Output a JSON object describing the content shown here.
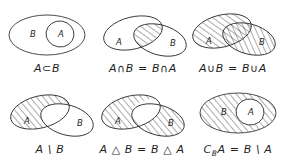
{
  "figure": {
    "background_color": "#ffffff",
    "stroke_color": "#2a2a2a",
    "hatch_color": "#2f2f2f",
    "columns": 3,
    "rows": 2
  },
  "panels": [
    {
      "id": "subset",
      "caption": "A⊂B",
      "caption_parts": {
        "lead": "A⊂B",
        "sub": ""
      },
      "labels": {
        "a": "A",
        "b": "B"
      },
      "shaded": "none",
      "layout": "nested",
      "description": "Ellipse A drawn inside ellipse B, nothing shaded"
    },
    {
      "id": "intersection",
      "caption": "A∩B = B∩A",
      "caption_parts": {
        "lead": "A∩B = B∩A",
        "sub": ""
      },
      "labels": {
        "a": "A",
        "b": "B"
      },
      "shaded": "intersection",
      "layout": "overlap",
      "description": "Two overlapping ellipses, only the lens intersection hatched"
    },
    {
      "id": "union",
      "caption": "A∪B = B∪A",
      "caption_parts": {
        "lead": "A∪B = B∪A",
        "sub": ""
      },
      "labels": {
        "a": "A",
        "b": "B"
      },
      "shaded": "union",
      "layout": "overlap",
      "description": "Two overlapping ellipses, entire union hatched"
    },
    {
      "id": "difference",
      "caption": "A \\ B",
      "caption_parts": {
        "lead": "A \\ B",
        "sub": ""
      },
      "labels": {
        "a": "A",
        "b": "B"
      },
      "shaded": "a-minus-b",
      "layout": "overlap",
      "description": "Two overlapping ellipses, only part of A outside B hatched"
    },
    {
      "id": "symmetric-difference",
      "caption": "A △ B = B △ A",
      "caption_parts": {
        "lead": "A △ B = B △ A",
        "sub": ""
      },
      "labels": {
        "a": "A",
        "b": "B"
      },
      "shaded": "symmetric-difference",
      "layout": "overlap",
      "description": "Two overlapping ellipses hatched except the lens intersection"
    },
    {
      "id": "complement",
      "caption_parts": {
        "lead": "C",
        "sub": "B",
        "tail": "A = B \\ A"
      },
      "caption": "CʙA = B \\ A",
      "labels": {
        "a": "A",
        "b": "B"
      },
      "shaded": "b-minus-a",
      "layout": "nested",
      "description": "Ellipse A nested in ellipse B, only B outside A hatched"
    }
  ]
}
